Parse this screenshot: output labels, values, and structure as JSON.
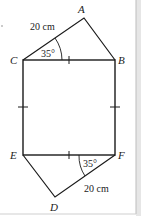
{
  "diagram": {
    "type": "geometry-figure",
    "points": {
      "A": {
        "label": "A",
        "x": 84,
        "y": 18
      },
      "B": {
        "label": "B",
        "x": 115,
        "y": 60
      },
      "C": {
        "label": "C",
        "x": 23,
        "y": 60
      },
      "D": {
        "label": "D",
        "x": 55,
        "y": 197
      },
      "E": {
        "label": "E",
        "x": 23,
        "y": 155
      },
      "F": {
        "label": "F",
        "x": 115,
        "y": 155
      }
    },
    "segments": [
      "CA",
      "AB",
      "CB",
      "CE",
      "BF",
      "EF",
      "ED",
      "DF"
    ],
    "annotations": {
      "top_length": "20 cm",
      "top_angle": "35°",
      "bottom_length": "20 cm",
      "bottom_angle": "35°"
    },
    "equal_marks": [
      "CB",
      "EF",
      "CE",
      "BF"
    ],
    "colors": {
      "line": "#1a1a1a",
      "border": "#c8c8c8",
      "background": "#ffffff"
    }
  }
}
